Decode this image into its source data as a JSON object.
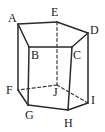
{
  "figure": {
    "type": "pentagonal-prism-diagram",
    "stroke_color": "#2b2b2b",
    "hidden_stroke_color": "#3a3a3a",
    "background_color": "#ffffff",
    "label_color": "#1a1a1a",
    "solid_stroke_width": 1.5,
    "hidden_stroke_width": 1.2,
    "hidden_dash_pattern": "3,2.5"
  },
  "vertices": [
    {
      "id": "A",
      "label": "A",
      "x": 18,
      "y": 24,
      "label_x": 8,
      "label_y": 12,
      "face": "top",
      "hidden": false
    },
    {
      "id": "E",
      "label": "E",
      "x": 57,
      "y": 22,
      "label_x": 51,
      "label_y": 6,
      "face": "top",
      "hidden": false
    },
    {
      "id": "D",
      "label": "D",
      "x": 88,
      "y": 33,
      "label_x": 90,
      "label_y": 24,
      "face": "top",
      "hidden": false
    },
    {
      "id": "B",
      "label": "B",
      "x": 29,
      "y": 47,
      "label_x": 31,
      "label_y": 49,
      "face": "top",
      "hidden": false
    },
    {
      "id": "C",
      "label": "C",
      "x": 72,
      "y": 47,
      "label_x": 73,
      "label_y": 49,
      "face": "top",
      "hidden": false
    },
    {
      "id": "F",
      "label": "F",
      "x": 18,
      "y": 90,
      "label_x": 6,
      "label_y": 84,
      "face": "bottom",
      "hidden": false
    },
    {
      "id": "G",
      "label": "G",
      "x": 28,
      "y": 105,
      "label_x": 25,
      "label_y": 109,
      "face": "bottom",
      "hidden": false
    },
    {
      "id": "H",
      "label": "H",
      "x": 68,
      "y": 110,
      "label_x": 64,
      "label_y": 117,
      "face": "bottom",
      "hidden": false
    },
    {
      "id": "I",
      "label": "I",
      "x": 88,
      "y": 103,
      "label_x": 91,
      "label_y": 94,
      "face": "bottom",
      "hidden": false
    },
    {
      "id": "J",
      "label": "J",
      "x": 57,
      "y": 85,
      "label_x": 53,
      "label_y": 86,
      "face": "bottom",
      "hidden": true
    }
  ],
  "edges": [
    {
      "id": "A-E",
      "from": "A",
      "to": "E",
      "hidden": false,
      "group": "top-face"
    },
    {
      "id": "E-D",
      "from": "E",
      "to": "D",
      "hidden": false,
      "group": "top-face"
    },
    {
      "id": "D-C",
      "from": "D",
      "to": "C",
      "hidden": false,
      "group": "top-face"
    },
    {
      "id": "C-B",
      "from": "C",
      "to": "B",
      "hidden": false,
      "group": "top-face"
    },
    {
      "id": "B-A",
      "from": "B",
      "to": "A",
      "hidden": false,
      "group": "top-face"
    },
    {
      "id": "F-G",
      "from": "F",
      "to": "G",
      "hidden": false,
      "group": "bottom-face"
    },
    {
      "id": "G-H",
      "from": "G",
      "to": "H",
      "hidden": false,
      "group": "bottom-face"
    },
    {
      "id": "H-I",
      "from": "H",
      "to": "I",
      "hidden": false,
      "group": "bottom-face"
    },
    {
      "id": "I-J",
      "from": "I",
      "to": "J",
      "hidden": true,
      "group": "bottom-face"
    },
    {
      "id": "J-F",
      "from": "J",
      "to": "F",
      "hidden": true,
      "group": "bottom-face"
    },
    {
      "id": "A-F",
      "from": "A",
      "to": "F",
      "hidden": false,
      "group": "lateral"
    },
    {
      "id": "B-G",
      "from": "B",
      "to": "G",
      "hidden": false,
      "group": "lateral"
    },
    {
      "id": "C-H",
      "from": "C",
      "to": "H",
      "hidden": false,
      "group": "lateral"
    },
    {
      "id": "D-I",
      "from": "D",
      "to": "I",
      "hidden": false,
      "group": "lateral"
    },
    {
      "id": "E-J",
      "from": "E",
      "to": "J",
      "hidden": true,
      "group": "lateral"
    }
  ]
}
